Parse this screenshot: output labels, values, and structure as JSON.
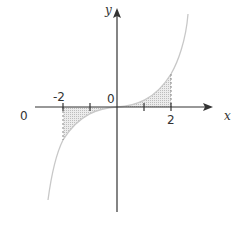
{
  "diagram": {
    "axes": {
      "x_label": "x",
      "y_label": "y",
      "origin_label": "0",
      "left_label": "0"
    },
    "ticks": [
      {
        "value": -2,
        "label": "-2"
      },
      {
        "value": -1,
        "label": ""
      },
      {
        "value": 1,
        "label": ""
      },
      {
        "value": 2,
        "label": "2"
      }
    ],
    "shaded_regions": [
      {
        "from": -2,
        "to": 0,
        "side": "below x-axis"
      },
      {
        "from": 0,
        "to": 2,
        "side": "above x-axis"
      }
    ],
    "colors": {
      "axis": "#333333",
      "curve": "#c8c8c8",
      "shade": "#d9d9d9",
      "dashed": "#888888"
    }
  }
}
